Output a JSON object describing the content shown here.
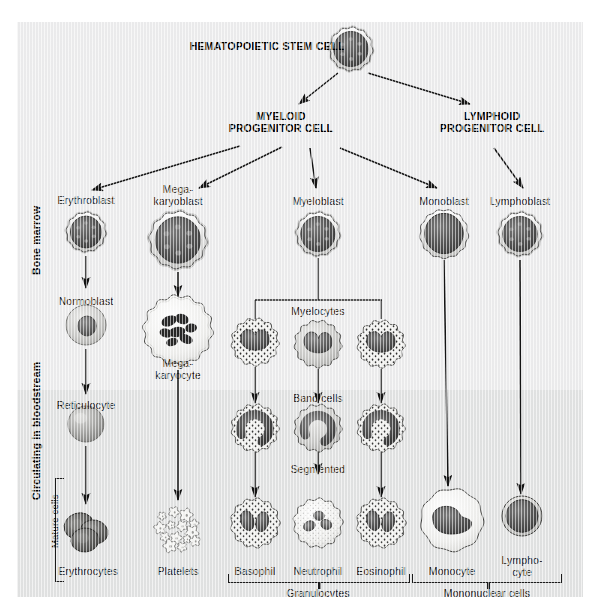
{
  "colors": {
    "panel_marrow": "#ededee",
    "panel_blood": "#e2e3e3",
    "ink": "#1a1a1a",
    "cytoplasm_light": "#f2f2f0",
    "nucleus_dark": "#4a4a4a",
    "nucleus_darker": "#3a3a3a"
  },
  "headers": [
    {
      "id": "stem",
      "text": "HEMATOPOIETIC STEM CELL",
      "x": 267,
      "y": 40
    },
    {
      "id": "myeloid",
      "text": "MYELOID\nPROGENITOR CELL",
      "x": 281,
      "y": 110
    },
    {
      "id": "lymphoid",
      "text": "LYMPHOID\nPROGENITOR CELL",
      "x": 492,
      "y": 110
    }
  ],
  "side_labels": [
    {
      "id": "bone-marrow",
      "text": "Bone marrow",
      "bold": true,
      "x": 30,
      "y": 275,
      "len": 90
    },
    {
      "id": "bloodstream",
      "text": "Circulating in bloodstream",
      "bold": true,
      "x": 30,
      "y": 500,
      "len": 160
    },
    {
      "id": "mature-cells",
      "text": "Mature cells",
      "bold": false,
      "x": 49,
      "y": 548,
      "len": 80
    }
  ],
  "cell_labels": [
    {
      "id": "erythroblast",
      "text": "Erythroblast",
      "x": 86,
      "y": 195
    },
    {
      "id": "megakaryoblast",
      "text": "Mega-\nkaryoblast",
      "x": 178,
      "y": 184
    },
    {
      "id": "myeloblast",
      "text": "Myeloblast",
      "x": 318,
      "y": 196
    },
    {
      "id": "monoblast",
      "text": "Monoblast",
      "x": 444,
      "y": 196
    },
    {
      "id": "lymphoblast",
      "text": "Lymphoblast",
      "x": 520,
      "y": 196
    },
    {
      "id": "normoblast",
      "text": "Normoblast",
      "x": 86,
      "y": 296
    },
    {
      "id": "megakaryocyte",
      "text": "Mega-\nkaryocyte",
      "x": 178,
      "y": 358
    },
    {
      "id": "myelocytes",
      "text": "Myelocytes",
      "x": 318,
      "y": 306
    },
    {
      "id": "reticulocyte",
      "text": "Reticulocyte",
      "x": 86,
      "y": 400
    },
    {
      "id": "bandcells",
      "text": "Band cells",
      "x": 318,
      "y": 393
    },
    {
      "id": "segmented",
      "text": "Segmented",
      "x": 318,
      "y": 464
    },
    {
      "id": "erythrocytes",
      "text": "Erythrocytes",
      "x": 88,
      "y": 566
    },
    {
      "id": "platelets",
      "text": "Platelets",
      "x": 178,
      "y": 566
    },
    {
      "id": "basophil",
      "text": "Basophil",
      "x": 255,
      "y": 566
    },
    {
      "id": "neutrophil",
      "text": "Neutrophil",
      "x": 318,
      "y": 566
    },
    {
      "id": "eosinophil",
      "text": "Eosinophil",
      "x": 381,
      "y": 566
    },
    {
      "id": "monocyte",
      "text": "Monocyte",
      "x": 452,
      "y": 566
    },
    {
      "id": "lymphocyte",
      "text": "Lympho-\ncyte",
      "x": 522,
      "y": 555
    }
  ],
  "group_labels": [
    {
      "id": "granulocytes",
      "text": "Granulocytes",
      "x": 318,
      "y": 588
    },
    {
      "id": "mononuclear-cells",
      "text": "Mononuclear cells",
      "x": 487,
      "y": 588
    }
  ],
  "cells": [
    {
      "id": "stem-cell",
      "kind": "blast",
      "cx": 351,
      "cy": 49,
      "r": 22
    },
    {
      "id": "erythroblast-cell",
      "kind": "blast",
      "cx": 86,
      "cy": 232,
      "r": 20
    },
    {
      "id": "megakaryoblast-cell",
      "kind": "blast",
      "cx": 178,
      "cy": 240,
      "r": 29
    },
    {
      "id": "myeloblast-cell",
      "kind": "blast",
      "cx": 318,
      "cy": 234,
      "r": 22
    },
    {
      "id": "monoblast-cell",
      "kind": "monoblast",
      "cx": 444,
      "cy": 234,
      "r": 24
    },
    {
      "id": "lymphoblast-cell",
      "kind": "blast",
      "cx": 520,
      "cy": 234,
      "r": 22
    },
    {
      "id": "normoblast-cell",
      "kind": "normoblast",
      "cx": 86,
      "cy": 325,
      "r": 20
    },
    {
      "id": "megakaryocyte-cell",
      "kind": "megakaryocyte",
      "cx": 178,
      "cy": 330,
      "r": 34
    },
    {
      "id": "myelocyte-baso",
      "kind": "granular",
      "cx": 255,
      "cy": 342,
      "r": 23
    },
    {
      "id": "myelocyte-neutro",
      "kind": "plain-gran",
      "cx": 318,
      "cy": 344,
      "r": 23
    },
    {
      "id": "myelocyte-eosino",
      "kind": "granular",
      "cx": 381,
      "cy": 344,
      "r": 23
    },
    {
      "id": "reticulocyte-cell",
      "kind": "reticulocyte",
      "cx": 86,
      "cy": 424,
      "r": 18
    },
    {
      "id": "band-baso",
      "kind": "band-gran",
      "cx": 255,
      "cy": 428,
      "r": 23
    },
    {
      "id": "band-neutro",
      "kind": "band-plain",
      "cx": 318,
      "cy": 428,
      "r": 23
    },
    {
      "id": "band-eosino",
      "kind": "band-gran",
      "cx": 381,
      "cy": 428,
      "r": 23
    },
    {
      "id": "erythrocytes-cells",
      "kind": "erythrocytes",
      "cx": 86,
      "cy": 530,
      "r": 26
    },
    {
      "id": "platelets-cells",
      "kind": "platelets",
      "cx": 178,
      "cy": 528,
      "r": 26
    },
    {
      "id": "basophil-cell",
      "kind": "seg-gran",
      "cx": 255,
      "cy": 523,
      "r": 24
    },
    {
      "id": "neutrophil-cell",
      "kind": "seg-plain",
      "cx": 318,
      "cy": 523,
      "r": 24
    },
    {
      "id": "eosinophil-cell",
      "kind": "seg-gran",
      "cx": 381,
      "cy": 523,
      "r": 24
    },
    {
      "id": "monocyte-cell",
      "kind": "monocyte",
      "cx": 452,
      "cy": 520,
      "r": 31
    },
    {
      "id": "lymphocyte-cell",
      "kind": "lymphocyte",
      "cx": 522,
      "cy": 516,
      "r": 20
    }
  ],
  "arrows": [
    {
      "id": "stem-to-myeloid",
      "x1": 338,
      "y1": 73,
      "x2": 299,
      "y2": 104
    },
    {
      "id": "stem-to-lymphoid",
      "x1": 368,
      "y1": 73,
      "x2": 470,
      "y2": 104
    },
    {
      "id": "myeloid-to-erythroblast",
      "x1": 240,
      "y1": 146,
      "x2": 92,
      "y2": 190
    },
    {
      "id": "myeloid-to-megakaryo",
      "x1": 282,
      "y1": 147,
      "x2": 199,
      "y2": 188
    },
    {
      "id": "myeloid-to-myeloblast",
      "x1": 310,
      "y1": 148,
      "x2": 316,
      "y2": 188
    },
    {
      "id": "myeloid-to-monoblast",
      "x1": 340,
      "y1": 148,
      "x2": 437,
      "y2": 188
    },
    {
      "id": "lymphoid-to-lymphoblast",
      "x1": 494,
      "y1": 148,
      "x2": 523,
      "y2": 188
    },
    {
      "id": "erythroblast-to-normoblast",
      "x1": 86,
      "y1": 256,
      "x2": 86,
      "y2": 288
    },
    {
      "id": "normoblast-to-reticulocyte",
      "x1": 86,
      "y1": 349,
      "x2": 86,
      "y2": 394
    },
    {
      "id": "reticulocyte-to-erythrocytes",
      "x1": 86,
      "y1": 446,
      "x2": 86,
      "y2": 504
    },
    {
      "id": "megakaryoblast-to-megakaryocyte",
      "x1": 178,
      "y1": 272,
      "x2": 178,
      "y2": 296
    },
    {
      "id": "megakaryocyte-to-platelets",
      "x1": 178,
      "y1": 370,
      "x2": 178,
      "y2": 500
    },
    {
      "id": "baso-myelo-to-band",
      "x1": 255,
      "y1": 367,
      "x2": 255,
      "y2": 403
    },
    {
      "id": "neutro-myelo-to-band",
      "x1": 318,
      "y1": 369,
      "x2": 318,
      "y2": 403
    },
    {
      "id": "eosino-myelo-to-band",
      "x1": 381,
      "y1": 369,
      "x2": 381,
      "y2": 403
    },
    {
      "id": "baso-band-to-seg",
      "x1": 255,
      "y1": 452,
      "x2": 255,
      "y2": 497
    },
    {
      "id": "neutro-band-to-seg",
      "x1": 318,
      "y1": 452,
      "x2": 318,
      "y2": 474
    },
    {
      "id": "eosino-band-to-seg",
      "x1": 381,
      "y1": 452,
      "x2": 381,
      "y2": 497
    },
    {
      "id": "monoblast-to-monocyte",
      "x1": 444,
      "y1": 260,
      "x2": 448,
      "y2": 486
    },
    {
      "id": "lymphoblast-to-lymphocyte",
      "x1": 520,
      "y1": 260,
      "x2": 521,
      "y2": 494
    }
  ],
  "connectors": [
    {
      "id": "myeloblast-stem",
      "type": "v",
      "x": 318,
      "y": 258,
      "h": 42
    },
    {
      "id": "myelocyte-bar",
      "type": "h",
      "x": 255,
      "y": 300,
      "w": 127
    },
    {
      "id": "myelocyte-drop-l",
      "type": "v",
      "x": 255,
      "y": 300,
      "h": 19
    },
    {
      "id": "myelocyte-drop-r",
      "type": "v",
      "x": 381,
      "y": 300,
      "h": 19
    }
  ],
  "brackets": [
    {
      "id": "mature-cells-bracket",
      "type": "left",
      "x": 55,
      "y": 478,
      "w": 8,
      "h": 102
    },
    {
      "id": "granulocytes-bracket",
      "type": "down",
      "x": 228,
      "y": 574,
      "w": 180,
      "h": 8
    },
    {
      "id": "mononuclear-bracket",
      "type": "down",
      "x": 412,
      "y": 574,
      "w": 148,
      "h": 8
    }
  ]
}
